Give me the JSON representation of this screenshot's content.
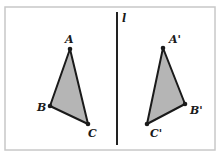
{
  "figure": {
    "frame": {
      "x": 5,
      "y": 7,
      "width": 210,
      "height": 143,
      "stroke": "#c8c8c8"
    },
    "mirror_line": {
      "label": "l",
      "x": 117,
      "y1": 12,
      "y2": 145,
      "color": "#222222",
      "label_x": 122,
      "label_y": 22
    },
    "original_triangle": {
      "fill": "#b5b5b5",
      "stroke": "#1a1a1a",
      "vertices": [
        {
          "name": "A",
          "x": 70,
          "y": 49,
          "label_x": 65,
          "label_y": 43
        },
        {
          "name": "B",
          "x": 50,
          "y": 106,
          "label_x": 37,
          "label_y": 111
        },
        {
          "name": "C",
          "x": 88,
          "y": 124,
          "label_x": 88,
          "label_y": 137
        }
      ]
    },
    "reflected_triangle": {
      "fill": "#b5b5b5",
      "stroke": "#1a1a1a",
      "vertices": [
        {
          "name": "A'",
          "x": 163,
          "y": 48,
          "label_x": 169,
          "label_y": 43
        },
        {
          "name": "B'",
          "x": 185,
          "y": 104,
          "label_x": 190,
          "label_y": 114
        },
        {
          "name": "C'",
          "x": 147,
          "y": 124,
          "label_x": 150,
          "label_y": 137
        }
      ]
    }
  }
}
